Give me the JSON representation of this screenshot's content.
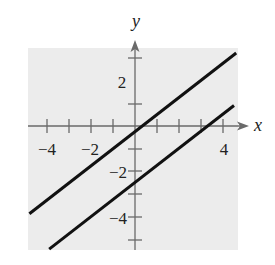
{
  "chart_data": {
    "type": "line",
    "title": "",
    "xlabel": "x",
    "ylabel": "y",
    "xlim": [
      -4.8,
      4.6
    ],
    "ylim": [
      -5.4,
      3.8
    ],
    "grid": false,
    "background": "#ececec",
    "x_tick_positions": [
      -4,
      -3,
      -2,
      -1,
      1,
      2,
      3,
      4
    ],
    "x_tick_labels": [
      {
        "value": -4,
        "label": "−4"
      },
      {
        "value": -2,
        "label": "−2"
      },
      {
        "value": 4,
        "label": "4"
      }
    ],
    "y_tick_positions": [
      -5,
      -4,
      -3,
      -2,
      -1,
      1,
      2,
      3
    ],
    "y_tick_labels": [
      {
        "value": 2,
        "label": "2"
      },
      {
        "value": -2,
        "label": "−2"
      },
      {
        "value": -4,
        "label": "−4"
      }
    ],
    "series": [
      {
        "name": "upper line",
        "equation": "y = 0.75x - 0.25",
        "slope": 0.75,
        "intercept": -0.25,
        "x": [
          -4.8,
          4.6
        ],
        "y": [
          -3.85,
          3.2
        ],
        "color": "#111111"
      },
      {
        "name": "lower line",
        "equation": "y = 0.75x - 2.5",
        "slope": 0.75,
        "intercept": -2.5,
        "x": [
          -3.9,
          4.5
        ],
        "y": [
          -5.4,
          0.9
        ],
        "color": "#111111"
      }
    ]
  },
  "labels": {
    "x_axis": "x",
    "y_axis": "y",
    "x_neg4": "−4",
    "x_neg2": "−2",
    "x_pos4": "4",
    "y_pos2": "2",
    "y_neg2": "−2",
    "y_neg4": "−4"
  }
}
